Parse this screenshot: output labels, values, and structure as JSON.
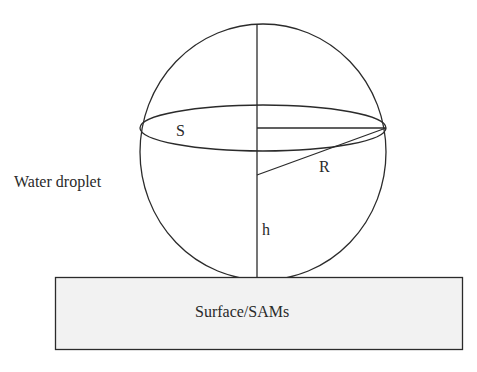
{
  "diagram": {
    "type": "water droplet on surface schematic",
    "labels": {
      "droplet": "Water droplet",
      "surface": "Surface/SAMs",
      "area": "S",
      "radius": "R",
      "height": "h"
    },
    "colors": {
      "line": "#2b2b2b",
      "surface_fill": "#f2f2f2",
      "text": "#2a2a2a"
    }
  }
}
